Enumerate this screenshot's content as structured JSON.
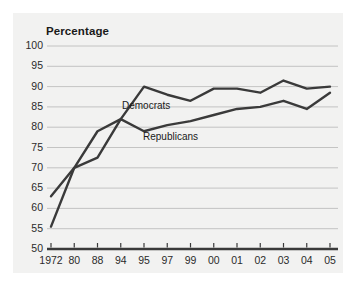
{
  "figure": {
    "background": "#ffffff",
    "panel_background": "#f2f2f1"
  },
  "chart_data": {
    "type": "line",
    "title": "",
    "ylabel": "Percentage",
    "xlabel": "",
    "ylim": [
      50,
      100
    ],
    "ytick_values": [
      100,
      95,
      90,
      85,
      80,
      75,
      70,
      65,
      60,
      55,
      50
    ],
    "ytick_labels": [
      "100",
      "95",
      "90",
      "85",
      "80",
      "75",
      "70",
      "65",
      "60",
      "55",
      "50"
    ],
    "categories": [
      "1972",
      "80",
      "88",
      "94",
      "95",
      "97",
      "99",
      "00",
      "01",
      "02",
      "03",
      "04",
      "05"
    ],
    "grid": true,
    "grid_color": "#b8b8b8",
    "legend_position": "inline-annotation",
    "series": [
      {
        "name": "Democrats",
        "color": "#3a3a3a",
        "values": [
          63,
          70,
          79,
          82,
          90,
          88,
          86.5,
          89.5,
          89.5,
          88.5,
          91.5,
          89.5,
          90
        ]
      },
      {
        "name": "Republicans",
        "color": "#3a3a3a",
        "values": [
          55.5,
          70,
          72.5,
          82,
          79,
          80.5,
          81.5,
          83,
          84.5,
          85,
          86.5,
          84.5,
          88.5
        ]
      }
    ],
    "annotations": [
      {
        "text": "Democrats",
        "series": "Democrats"
      },
      {
        "text": "Republicans",
        "series": "Republicans"
      }
    ]
  }
}
